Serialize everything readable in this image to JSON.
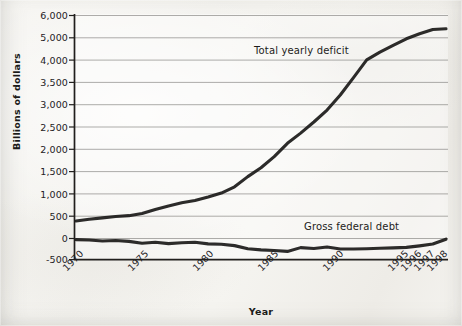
{
  "figure": {
    "y_axis_title": "Billions of dollars",
    "x_axis_title": "Year"
  },
  "annotations": {
    "upper_series": "Total yearly deficit",
    "lower_series": "Gross federal debt"
  },
  "chart_data": {
    "type": "line",
    "title": "",
    "xlabel": "Year",
    "ylabel": "Billions of dollars",
    "grid": true,
    "legend_position": "inline-annotation",
    "x_tick_labels": [
      "1970",
      "1975",
      "1980",
      "1985",
      "1990",
      "1995",
      "1996",
      "1997",
      "1998"
    ],
    "y_tick_labels": [
      "6,000",
      "5,000",
      "4,000",
      "3,500",
      "3,000",
      "2,500",
      "2,000",
      "1,500",
      "1,000",
      "500",
      "0",
      "-500"
    ],
    "y_tick_values": [
      6000,
      5000,
      4000,
      3500,
      3000,
      2500,
      2000,
      1500,
      1000,
      500,
      0,
      -500
    ],
    "ylim": [
      -500,
      6000
    ],
    "note_on_axis": "Y tick labels are spaced evenly on the plot but the interval changes from 1,000 (6,000-4,000) to 500 (4,000--500)",
    "x": [
      1970,
      1971,
      1972,
      1973,
      1974,
      1975,
      1976,
      1977,
      1978,
      1979,
      1980,
      1981,
      1982,
      1983,
      1984,
      1985,
      1986,
      1987,
      1988,
      1989,
      1990,
      1991,
      1992,
      1993,
      1994,
      1995,
      1996,
      1997,
      1998
    ],
    "series": [
      {
        "name": "Total yearly deficit",
        "values": [
          370,
          410,
          440,
          470,
          490,
          540,
          630,
          710,
          780,
          830,
          910,
          1000,
          1140,
          1370,
          1570,
          1820,
          2120,
          2350,
          2600,
          2870,
          3210,
          3600,
          4000,
          4350,
          4650,
          4950,
          5180,
          5370,
          5400
        ]
      },
      {
        "name": "Gross federal debt",
        "values": [
          -50,
          -60,
          -80,
          -70,
          -90,
          -130,
          -110,
          -140,
          -120,
          -110,
          -145,
          -155,
          -185,
          -255,
          -280,
          -295,
          -315,
          -230,
          -250,
          -215,
          -260,
          -260,
          -255,
          -245,
          -235,
          -225,
          -190,
          -150,
          -40
        ]
      }
    ]
  }
}
